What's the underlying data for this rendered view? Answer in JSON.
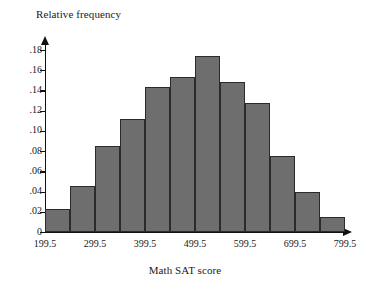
{
  "chart_data": {
    "type": "bar",
    "title": "",
    "subtitle": "",
    "xlabel": "Math SAT score",
    "ylabel": "Relative frequency",
    "grid": false,
    "legend": false,
    "legend_position": "none",
    "bar_color": "#6e6e6e",
    "bar_edge_color": "#2b2b2b",
    "axis_color": "#111111",
    "background_color": "#ffffff",
    "bin_width": 50,
    "xlim": [
      199.5,
      799.5
    ],
    "ylim": [
      0,
      0.185
    ],
    "x_tick_labels": [
      "199.5",
      "299.5",
      "399.5",
      "499.5",
      "599.5",
      "699.5",
      "799.5"
    ],
    "x_tick_values": [
      199.5,
      299.5,
      399.5,
      499.5,
      599.5,
      699.5,
      799.5
    ],
    "y_tick_labels": [
      "0",
      ".02",
      ".04",
      ".06",
      ".08",
      ".10",
      ".12",
      ".14",
      ".16",
      ".18"
    ],
    "y_tick_values": [
      0,
      0.02,
      0.04,
      0.06,
      0.08,
      0.1,
      0.12,
      0.14,
      0.16,
      0.18
    ],
    "bin_edges": [
      199.5,
      249.5,
      299.5,
      349.5,
      399.5,
      449.5,
      499.5,
      549.5,
      599.5,
      649.5,
      699.5,
      749.5,
      799.5
    ],
    "categories": [
      "199.5-249.5",
      "249.5-299.5",
      "299.5-349.5",
      "349.5-399.5",
      "399.5-449.5",
      "449.5-499.5",
      "499.5-549.5",
      "549.5-599.5",
      "599.5-649.5",
      "649.5-699.5",
      "699.5-749.5",
      "749.5-799.5"
    ],
    "values": [
      0.023,
      0.046,
      0.085,
      0.112,
      0.143,
      0.153,
      0.174,
      0.148,
      0.128,
      0.075,
      0.04,
      0.015
    ]
  }
}
